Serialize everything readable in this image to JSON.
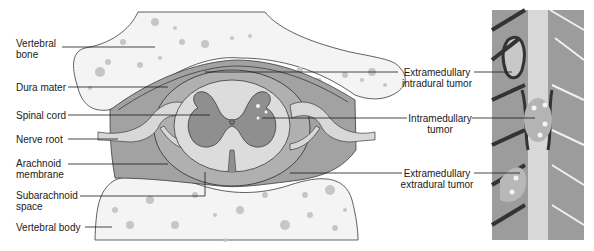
{
  "figure": {
    "type": "anatomical cross-section diagram",
    "colors": {
      "bone": "#f4f4f4",
      "bone_dots": "#c8c8c8",
      "dura": "#9e9e9e",
      "subarachnoid": "#a8a8a8",
      "cord_white_matter": "#dadada",
      "cord_gray_matter": "#8f8f8f",
      "outline": "#3a3a3a",
      "nerve_root": "#d6d6d6",
      "leader_line": "#1a1a1a"
    }
  },
  "left_labels": [
    {
      "id": "vertebral-bone",
      "line1": "Vertebral",
      "line2": "bone"
    },
    {
      "id": "dura-mater",
      "line1": "Dura mater"
    },
    {
      "id": "spinal-cord",
      "line1": "Spinal cord"
    },
    {
      "id": "nerve-root",
      "line1": "Nerve root"
    },
    {
      "id": "arachnoid-membrane",
      "line1": "Arachnoid",
      "line2": "membrane"
    },
    {
      "id": "subarachnoid-space",
      "line1": "Subarachnoid",
      "line2": "space"
    },
    {
      "id": "vertebral-body",
      "line1": "Vertebral body"
    }
  ],
  "right_labels": [
    {
      "id": "extramedullary-intradural-tumor",
      "line1": "Extramedullary",
      "line2": "intradural tumor"
    },
    {
      "id": "intramedullary-tumor",
      "line1": "Intramedullary",
      "line2": "tumor"
    },
    {
      "id": "extramedullary-extradural-tumor",
      "line1": "Extramedullary",
      "line2": "extradural tumor"
    }
  ]
}
